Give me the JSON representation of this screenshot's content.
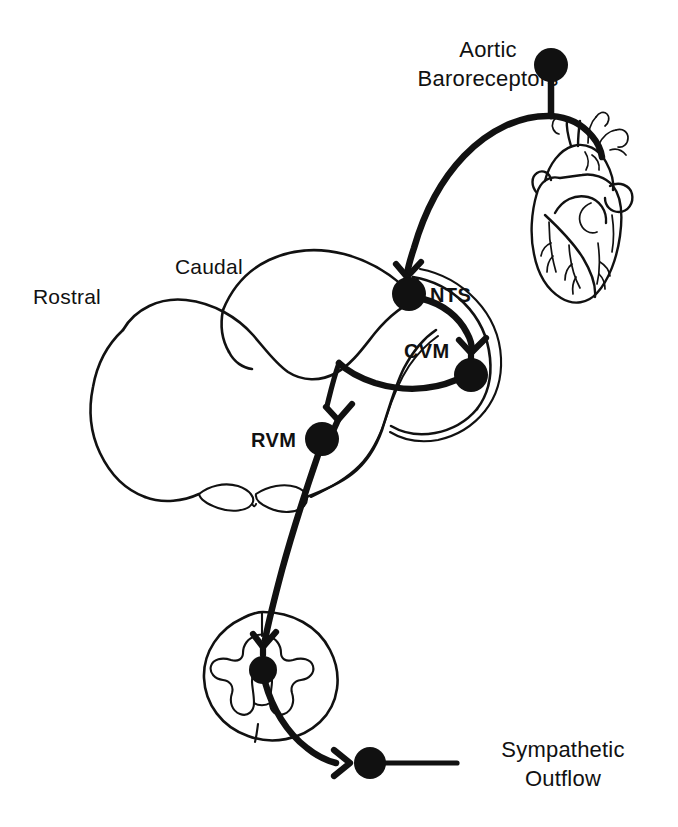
{
  "figure": {
    "background_color": "#ffffff",
    "ink_color": "#111111"
  },
  "labels": {
    "aortic_baroreceptors_line1": "Aortic",
    "aortic_baroreceptors_line2": "Baroreceptors",
    "rostral": "Rostral",
    "caudal": "Caudal",
    "nts": "NTS",
    "cvm": "CVM",
    "rvm": "RVM",
    "sympathetic_outflow_line1": "Sympathetic",
    "sympathetic_outflow_line2": "Outflow"
  },
  "nodes": [
    {
      "id": "baroreceptor-soma",
      "label": "Aortic Baroreceptors",
      "x": 551,
      "y": 65,
      "r": 17
    },
    {
      "id": "nts-soma",
      "label": "NTS",
      "x": 409,
      "y": 294,
      "r": 17
    },
    {
      "id": "cvm-soma",
      "label": "CVM",
      "x": 471,
      "y": 375,
      "r": 17
    },
    {
      "id": "rvm-soma",
      "label": "RVM",
      "x": 322,
      "y": 439,
      "r": 17
    },
    {
      "id": "spinal-soma",
      "label": "Spinal preganglionic neuron",
      "x": 263,
      "y": 670,
      "r": 14
    },
    {
      "id": "sympathetic-soma",
      "label": "Sympathetic ganglion neuron",
      "x": 370,
      "y": 763,
      "r": 16
    }
  ],
  "structures": [
    {
      "id": "heart",
      "label": "Heart"
    },
    {
      "id": "brainstem",
      "label": "Brainstem sagittal outline"
    },
    {
      "id": "spinal-cord",
      "label": "Spinal cord cross section"
    }
  ],
  "connections": [
    {
      "from": "baroreceptor-soma",
      "to": "heart",
      "label": "afferent peripheral branch"
    },
    {
      "from": "baroreceptor-soma",
      "to": "nts-soma",
      "label": "afferent central branch"
    },
    {
      "from": "nts-soma",
      "to": "cvm-soma",
      "label": "excitatory projection"
    },
    {
      "from": "cvm-soma",
      "to": "rvm-soma",
      "label": "inhibitory projection"
    },
    {
      "from": "rvm-soma",
      "to": "spinal-soma",
      "label": "bulbospinal projection"
    },
    {
      "from": "spinal-soma",
      "to": "sympathetic-soma",
      "label": "preganglionic axon"
    },
    {
      "from": "sympathetic-soma",
      "to": "sympathetic-outflow",
      "label": "postganglionic outflow"
    }
  ]
}
